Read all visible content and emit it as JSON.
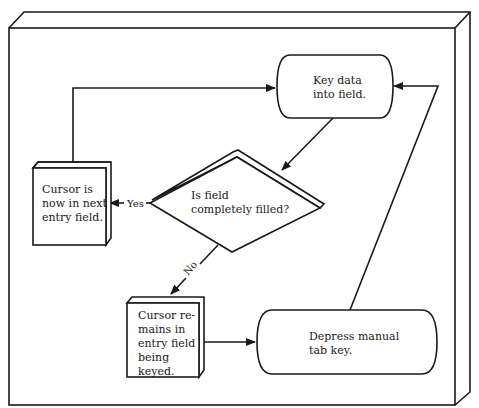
{
  "diagram": {
    "type": "flowchart",
    "nodes": [
      {
        "id": "key_data",
        "shape": "terminal",
        "lines": [
          "Key data",
          "into field."
        ]
      },
      {
        "id": "decision",
        "shape": "diamond",
        "lines": [
          "Is field",
          "completely filled?"
        ]
      },
      {
        "id": "cursor_next",
        "shape": "box-3d",
        "lines": [
          "Cursor is",
          "now in next",
          "entry field."
        ]
      },
      {
        "id": "cursor_remains",
        "shape": "box-3d",
        "lines": [
          "Cursor re-",
          "mains in",
          "entry field",
          "being",
          "keyed."
        ]
      },
      {
        "id": "depress_tab",
        "shape": "terminal",
        "lines": [
          "Depress manual",
          "tab key."
        ]
      }
    ],
    "edges": [
      {
        "from": "key_data",
        "to": "decision",
        "label": ""
      },
      {
        "from": "decision",
        "to": "cursor_next",
        "label": "Yes"
      },
      {
        "from": "decision",
        "to": "cursor_remains",
        "label": "No"
      },
      {
        "from": "cursor_remains",
        "to": "depress_tab",
        "label": ""
      },
      {
        "from": "depress_tab",
        "to": "key_data",
        "label": ""
      },
      {
        "from": "cursor_next",
        "to": "key_data",
        "label": ""
      }
    ],
    "colors": {
      "line": "#1a1a1a",
      "background": "#ffffff"
    }
  }
}
